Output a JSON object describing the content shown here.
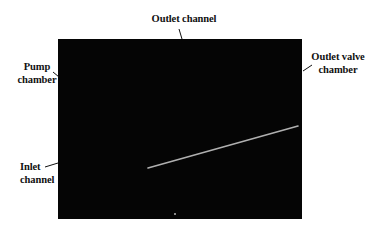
{
  "figure": {
    "image_background": "#050505",
    "labels": {
      "outlet_channel": "Outlet channel",
      "pump_chamber_line1": "Pump",
      "pump_chamber_line2": "chamber",
      "outlet_valve_line1": "Outlet valve",
      "outlet_valve_line2": "chamber",
      "inlet_line1": "Inlet",
      "inlet_line2": "channel"
    },
    "line_color": "#b0b0b0",
    "leader_color": "#111111"
  }
}
